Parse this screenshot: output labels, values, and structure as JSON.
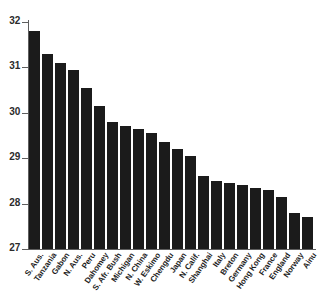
{
  "chart_data": {
    "type": "bar",
    "title": "",
    "subtitle": "",
    "xlabel": "",
    "ylabel": "",
    "ylim": [
      27,
      32
    ],
    "yticks": [
      27,
      28,
      29,
      30,
      31,
      32
    ],
    "ytick_labels": [
      "27",
      "28",
      "29",
      "30",
      "31",
      "32"
    ],
    "grid": false,
    "legend": "none",
    "categories": [
      "S. Aus.",
      "Tanzania",
      "Gabon",
      "N. Aus.",
      "Peru",
      "Dahomey",
      "S. Afr. Bush",
      "Michigan",
      "N. China",
      "W. Eskimo",
      "Chengdu",
      "Japan",
      "N. Calif.",
      "Shanghai",
      "Italy",
      "Breton",
      "Germany",
      "Hong Kong",
      "France",
      "England",
      "Norway",
      "Ainu"
    ],
    "values": [
      31.8,
      31.3,
      31.1,
      30.95,
      30.55,
      30.15,
      29.8,
      29.7,
      29.65,
      29.55,
      29.35,
      29.2,
      29.05,
      28.6,
      28.5,
      28.45,
      28.4,
      28.35,
      28.3,
      28.15,
      27.8,
      27.7
    ],
    "bar_color": "#1b1b1b",
    "axis_color": "#5e5e5e",
    "background_color": "#ffffff"
  }
}
